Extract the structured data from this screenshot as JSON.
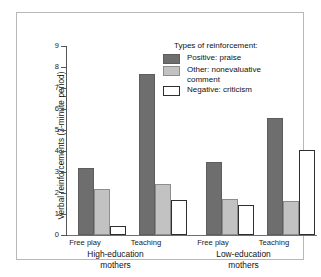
{
  "chart_data": {
    "type": "bar",
    "title": "",
    "xlabel": "",
    "ylabel": "Verbal reinforcements (3-minute period)",
    "ylim": [
      0,
      9
    ],
    "yticks": [
      0,
      1,
      2,
      3,
      4,
      5,
      6,
      7,
      8,
      9
    ],
    "ytick_labels": [
      "0",
      "1",
      "2",
      "3",
      "4",
      "5",
      "6",
      "7",
      "8",
      "9"
    ],
    "grid": false,
    "legend_position": "upper right",
    "legend_title": "Types of reinforcement:",
    "categories": [
      "Free play",
      "Teaching",
      "Free play",
      "Teaching"
    ],
    "groups": [
      {
        "label": "High-education\nmothers",
        "line1": "High-education",
        "line2": "mothers",
        "categories": [
          "Free play",
          "Teaching"
        ]
      },
      {
        "label": "Low-education\nmothers",
        "line1": "Low-education",
        "line2": "mothers",
        "categories": [
          "Free play",
          "Teaching"
        ]
      }
    ],
    "series": [
      {
        "name": "Positive:  praise",
        "color": "#6e6e6e",
        "values": [
          3.2,
          7.65,
          3.5,
          5.55
        ]
      },
      {
        "name": "Other:  nonevaluative\ncomment",
        "color": "#c2c2c2",
        "values": [
          2.18,
          2.45,
          1.72,
          1.6
        ]
      },
      {
        "name": "Negative:  criticism",
        "color": "#ffffff",
        "values": [
          0.45,
          1.65,
          1.42,
          4.05
        ]
      }
    ]
  },
  "legend": {
    "title": "Types of reinforcement:",
    "items": [
      {
        "swatch": "positive-swatch",
        "label": "Positive:  praise"
      },
      {
        "swatch": "other-swatch",
        "label": "Other:  nonevaluative\ncomment"
      },
      {
        "swatch": "negative-swatch",
        "label": "Negative:  criticism"
      }
    ]
  },
  "axes": {
    "y_title": "Verbal reinforcements (3-minute period)"
  }
}
